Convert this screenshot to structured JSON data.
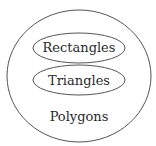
{
  "diagram": {
    "type": "nested-set",
    "outer_set": {
      "label": "Polygons"
    },
    "inner_sets": [
      {
        "label": "Rectangles"
      },
      {
        "label": "Triangles"
      }
    ],
    "stroke_color": "#555555"
  }
}
